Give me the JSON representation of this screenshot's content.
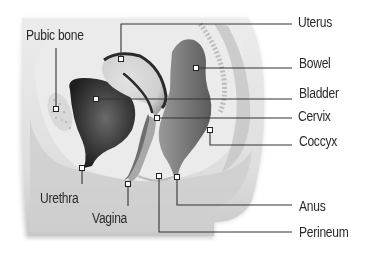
{
  "diagram": {
    "type": "anatomical-cross-section",
    "colors": {
      "background": "#ffffff",
      "body_tissue": "#e6e6e6",
      "body_shadow": "#bdbdbd",
      "bladder": "#3c3c3c",
      "uterus": "#d2d2d2",
      "uterus_outline": "#2a2a2a",
      "bowel": "#7a7a7a",
      "leader_line": "#333333",
      "label_text": "#2a2a2a"
    },
    "labels": [
      {
        "id": "uterus",
        "text": "Uterus"
      },
      {
        "id": "pubic_bone",
        "text": "Pubic bone"
      },
      {
        "id": "bowel",
        "text": "Bowel"
      },
      {
        "id": "bladder",
        "text": "Bladder"
      },
      {
        "id": "cervix",
        "text": "Cervix"
      },
      {
        "id": "coccyx",
        "text": "Coccyx"
      },
      {
        "id": "urethra",
        "text": "Urethra"
      },
      {
        "id": "vagina",
        "text": "Vagina"
      },
      {
        "id": "anus",
        "text": "Anus"
      },
      {
        "id": "perineum",
        "text": "Perineum"
      }
    ]
  }
}
